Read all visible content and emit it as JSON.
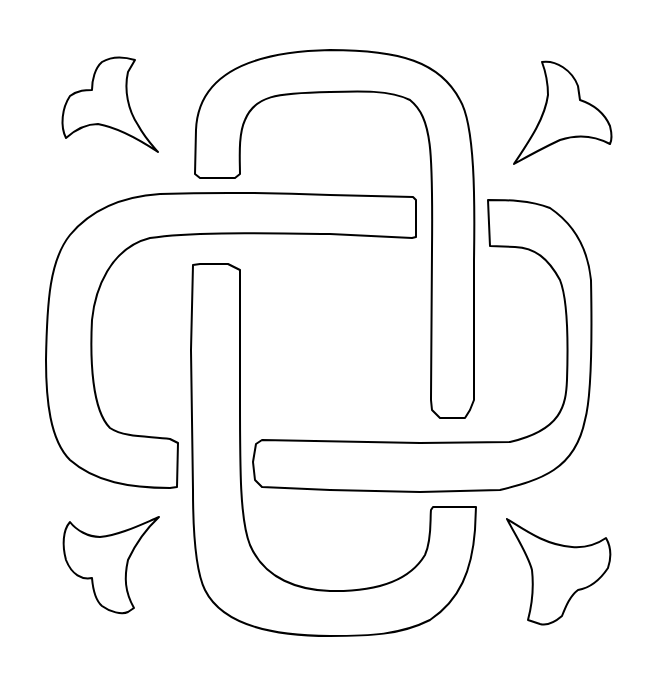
{
  "artwork": {
    "subject": "Celtic knot line drawing",
    "background_color": "#ffffff",
    "stroke_color": "#000000",
    "elements": [
      {
        "name": "top-band",
        "label": "Top loop band"
      },
      {
        "name": "left-band",
        "label": "Left loop band"
      },
      {
        "name": "right-band",
        "label": "Right loop band"
      },
      {
        "name": "bottom-band",
        "label": "Bottom loop band"
      },
      {
        "name": "leaf-top-left",
        "label": "Top-left leaf ornament"
      },
      {
        "name": "leaf-top-right",
        "label": "Top-right leaf ornament"
      },
      {
        "name": "leaf-bottom-left",
        "label": "Bottom-left leaf ornament"
      },
      {
        "name": "leaf-bottom-right",
        "label": "Bottom-right leaf ornament"
      }
    ]
  }
}
